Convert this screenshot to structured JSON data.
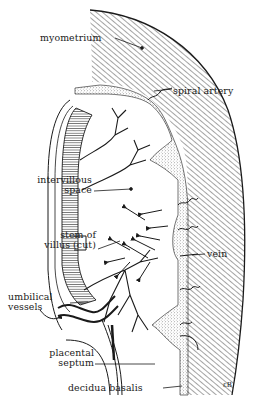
{
  "figure": {
    "signature": "εB",
    "colors": {
      "ink": "#1a1a1a",
      "background": "#ffffff",
      "stipple": "#777777"
    }
  },
  "labels": [
    {
      "id": "myometrium",
      "lines": [
        "myometrium"
      ]
    },
    {
      "id": "spiral-artery",
      "lines": [
        "spiral artery"
      ]
    },
    {
      "id": "intervillous-space",
      "lines": [
        "intervillous",
        "space"
      ]
    },
    {
      "id": "stem-of-villus",
      "lines": [
        "stem of",
        "villus (cut)"
      ]
    },
    {
      "id": "vein",
      "lines": [
        "vein"
      ]
    },
    {
      "id": "umbilical-vessels",
      "lines": [
        "umbilical",
        "vessels"
      ]
    },
    {
      "id": "placental-septum",
      "lines": [
        "placental",
        "septum"
      ]
    },
    {
      "id": "decidua-basalis",
      "lines": [
        "decidua basalis"
      ]
    }
  ]
}
